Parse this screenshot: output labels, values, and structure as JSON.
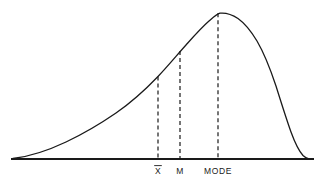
{
  "figure": {
    "background_color": "#ffffff",
    "ink_color": "#1a1a1a",
    "axis": {
      "name": "baseline-axis",
      "x_start": 11,
      "x_end": 314,
      "y": 159,
      "stroke_width": 1.8
    },
    "curve": {
      "name": "distribution-curve",
      "stroke_width": 1.3,
      "path": "M 13 158.5 C 30 156.5, 48 150.5, 66 142 C 84 133.5, 100 124, 116 113 C 132 102, 146 89, 158 76.5 C 168 66, 177 55, 186 45 C 194 36, 201 28, 209 21 C 213 17.5, 216 14.5, 220 13.2 C 226 12.6, 232 14.5, 238 18.5 C 245 23.5, 251 31, 257 41 C 264 53, 270 68, 276 86 C 281 102, 286 118, 291 132 C 295 143, 299 151, 303 155.5 C 305 157.5, 307 158.4, 309 158.8"
    },
    "markers": [
      {
        "id": "mean",
        "name": "mean-marker",
        "label": "X",
        "has_overbar": true,
        "x": 158,
        "curve_y": 76.5,
        "label_x": 158,
        "label_y": 174
      },
      {
        "id": "median",
        "name": "median-marker",
        "label": "M",
        "has_overbar": false,
        "x": 180,
        "curve_y": 51,
        "label_x": 180,
        "label_y": 174
      },
      {
        "id": "mode",
        "name": "mode-marker",
        "label": "MODE",
        "has_overbar": false,
        "x": 218,
        "curve_y": 13.2,
        "label_x": 218,
        "label_y": 174
      }
    ],
    "dash_pattern": "4,3",
    "dash_stroke_width": 1.2
  }
}
